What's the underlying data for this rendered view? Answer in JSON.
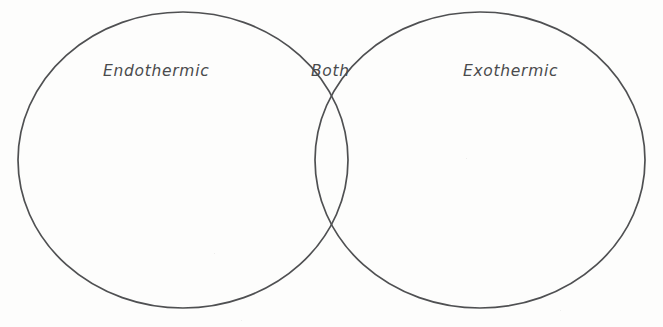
{
  "diagram": {
    "type": "venn",
    "title": "",
    "set_count": 2,
    "background_color": "#fdfdfc",
    "stroke_color": "#4f5052",
    "text_color": "#4a4b4d",
    "regions": [
      {
        "id": "left-only",
        "label": "Endothermic",
        "items": []
      },
      {
        "id": "intersection",
        "label": "Both",
        "items": []
      },
      {
        "id": "right-only",
        "label": "Exothermic",
        "items": []
      }
    ],
    "labels": {
      "left": "Endothermic",
      "center": "Both",
      "right": "Exothermic"
    },
    "geometry": {
      "left_ellipse": {
        "cx": 183,
        "cy": 160,
        "rx": 165,
        "ry": 148
      },
      "right_ellipse": {
        "cx": 480,
        "cy": 160,
        "rx": 165,
        "ry": 148
      }
    }
  }
}
